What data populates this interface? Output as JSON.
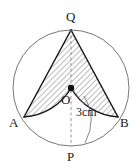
{
  "figure": {
    "type": "geometry-diagram",
    "background_color": "#ffffff",
    "stroke_color": "#1a1a1a",
    "circle_stroke_color": "#555555",
    "hatch_color": "#666666",
    "labels": {
      "apex_top": "Q",
      "center": "O",
      "left": "A",
      "right": "B",
      "bottom": "P",
      "dimension": "3cm"
    },
    "points": {
      "Q": {
        "x": 71,
        "y": 30
      },
      "O": {
        "x": 71,
        "y": 88
      },
      "A": {
        "x": 24,
        "y": 117
      },
      "B": {
        "x": 118,
        "y": 117
      },
      "P": {
        "x": 71,
        "y": 146
      }
    },
    "circle": {
      "cx": 71,
      "cy": 88,
      "r": 58
    },
    "dimension_value": 3,
    "dimension_unit": "cm"
  }
}
